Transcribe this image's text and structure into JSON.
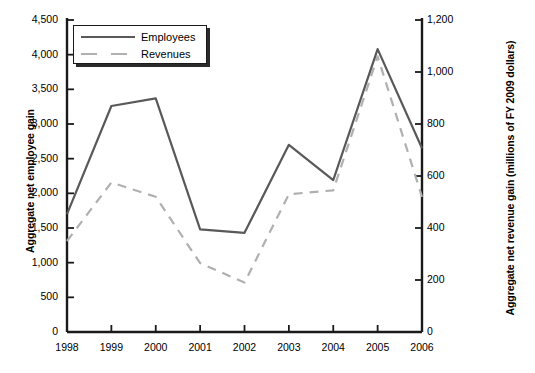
{
  "chart_data": {
    "type": "line",
    "title": "",
    "x": [
      "1998",
      "1999",
      "2000",
      "2001",
      "2002",
      "2003",
      "2004",
      "2005",
      "2006"
    ],
    "xlabel": "",
    "ylabel": "Aggregate net employee gain",
    "y2label": "Aggregate net revenue gain (millions of FY 2009 dollars)",
    "ylim": [
      0,
      4500
    ],
    "y2lim": [
      0,
      1200
    ],
    "yticks": [
      "0",
      "500",
      "1,000",
      "1,500",
      "2,000",
      "2,500",
      "3,000",
      "3,500",
      "4,000",
      "4,500"
    ],
    "y2ticks": [
      "0",
      "200",
      "400",
      "600",
      "800",
      "1,000",
      "1,200"
    ],
    "grid": false,
    "legend_position": "top-left",
    "series": [
      {
        "name": "Employees",
        "axis": "left",
        "style": "solid",
        "color": "#595959",
        "values": [
          1700,
          3260,
          3370,
          1480,
          1430,
          2700,
          2190,
          4080,
          2650
        ]
      },
      {
        "name": "Revenues",
        "axis": "right",
        "style": "dashed",
        "color": "#b0b0b0",
        "values": [
          350,
          575,
          520,
          265,
          190,
          530,
          545,
          1060,
          520
        ]
      }
    ]
  },
  "legend": {
    "items": [
      {
        "label": "Employees"
      },
      {
        "label": "Revenues"
      }
    ]
  },
  "axes": {
    "left_title": "Aggregate net employee gain",
    "right_title": "Aggregate net revenue gain (millions of FY 2009 dollars)"
  },
  "colors": {
    "employees_line": "#595959",
    "revenues_line": "#b0b0b0",
    "axis": "#1a1a1a",
    "background": "#ffffff"
  }
}
